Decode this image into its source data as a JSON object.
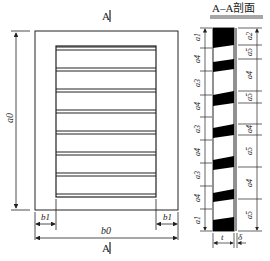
{
  "front_view": {
    "section_marker_top": "A",
    "section_marker_bottom": "A",
    "height_label": "a0",
    "width_label": "b0",
    "margin_left_label": "b1",
    "margin_right_label": "b1",
    "slat_count": 8
  },
  "section_view": {
    "title": "A–A剖面",
    "left_dims": [
      "a1",
      "a4",
      "a3",
      "a4",
      "a3",
      "a4",
      "a3",
      "a4",
      "a1"
    ],
    "right_dims": [
      "a2",
      "a5",
      "a4",
      "a5",
      "a4",
      "a5",
      "a4",
      "a5",
      "a2"
    ],
    "thickness_label": "t",
    "plate_label": "δ"
  },
  "colors": {
    "line": "#222222",
    "fill": "#000000",
    "background": "#ffffff"
  }
}
